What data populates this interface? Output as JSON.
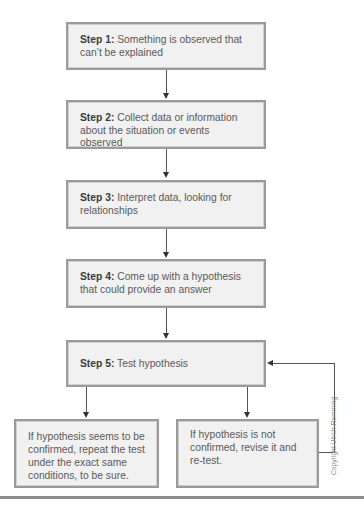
{
  "diagram": {
    "type": "flowchart",
    "steps": [
      {
        "label": "Step 1:",
        "text": " Something is observed that can’t be explained"
      },
      {
        "label": "Step 2:",
        "text": " Collect data or information about the situation or events observed"
      },
      {
        "label": "Step 3:",
        "text": " Interpret data, looking for relationships"
      },
      {
        "label": "Step 4:",
        "text": " Come up with a hypothesis that could provide an answer"
      },
      {
        "label": "Step 5:",
        "text": " Test hypothesis"
      }
    ],
    "outcomes": [
      {
        "text": "If hypothesis seems to be confirmed, repeat the test under the exact same conditions, to be sure."
      },
      {
        "text": "If hypothesis is not confirmed, revise it and re-test."
      }
    ],
    "copyright": "Copyright Ulrich Remming",
    "colors": {
      "box_fill": "#f1f1f1",
      "box_border": "#9a9a9a",
      "arrow": "#333333",
      "rule": "#8c8c8c"
    }
  }
}
